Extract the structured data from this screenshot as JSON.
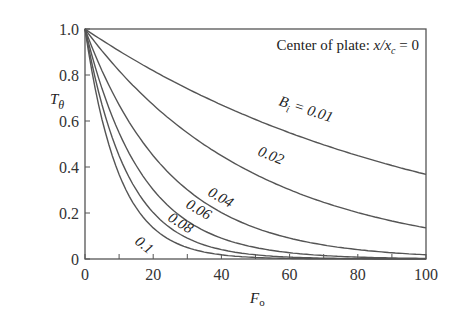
{
  "chart_data": {
    "type": "line",
    "title_parts": {
      "prefix": "Center of plate: ",
      "var": "x/x",
      "sub": "c",
      "suffix": " = 0"
    },
    "xlabel": "F_o",
    "ylabel": "T_θ",
    "xlim": [
      0,
      100
    ],
    "ylim": [
      0,
      1.0
    ],
    "xticks": [
      "0",
      "20",
      "40",
      "60",
      "80",
      "100"
    ],
    "yticks": [
      "0",
      "0.2",
      "0.4",
      "0.6",
      "0.8",
      "1.0"
    ],
    "grid": false,
    "legend": "inline labels",
    "x": [
      0,
      10,
      20,
      30,
      40,
      50,
      60,
      70,
      80,
      90,
      100
    ],
    "series": [
      {
        "name": "B_i = 0.01",
        "label": "B_i = 0.01",
        "values": [
          1.0,
          0.9,
          0.82,
          0.74,
          0.67,
          0.61,
          0.55,
          0.5,
          0.45,
          0.41,
          0.37
        ]
      },
      {
        "name": "0.02",
        "label": "0.02",
        "values": [
          1.0,
          0.82,
          0.67,
          0.55,
          0.45,
          0.37,
          0.3,
          0.25,
          0.2,
          0.17,
          0.14
        ]
      },
      {
        "name": "0.04",
        "label": "0.04",
        "values": [
          1.0,
          0.67,
          0.45,
          0.3,
          0.2,
          0.14,
          0.09,
          0.06,
          0.04,
          0.03,
          0.02
        ]
      },
      {
        "name": "0.06",
        "label": "0.06",
        "values": [
          1.0,
          0.55,
          0.3,
          0.17,
          0.09,
          0.05,
          0.03,
          0.015,
          0.01,
          0.005,
          0.002
        ]
      },
      {
        "name": "0.08",
        "label": "0.08",
        "values": [
          1.0,
          0.45,
          0.2,
          0.09,
          0.04,
          0.02,
          0.01,
          0.004,
          0.002,
          0.001,
          0.0
        ]
      },
      {
        "name": "0.1",
        "label": "0.1",
        "values": [
          1.0,
          0.37,
          0.14,
          0.05,
          0.02,
          0.007,
          0.002,
          0.001,
          0.0,
          0.0,
          0.0
        ]
      }
    ]
  }
}
